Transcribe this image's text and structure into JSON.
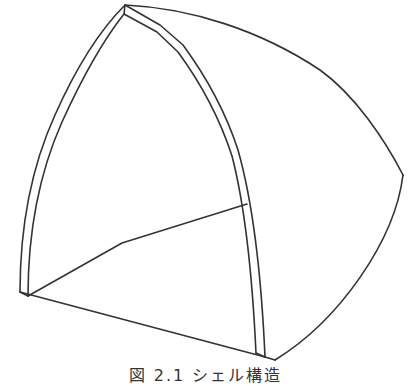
{
  "figure": {
    "caption": "図 2.1  シェル構造",
    "stroke_color": "#333333",
    "background": "#ffffff"
  }
}
